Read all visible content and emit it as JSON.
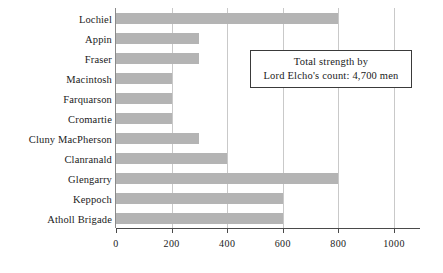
{
  "chart_data": {
    "type": "bar",
    "orientation": "horizontal",
    "title": "",
    "xlabel": "",
    "ylabel": "",
    "categories": [
      "Lochiel",
      "Appin",
      "Fraser",
      "Macintosh",
      "Farquarson",
      "Cromartie",
      "Cluny MacPherson",
      "Clanranald",
      "Glengarry",
      "Keppoch",
      "Atholl Brigade"
    ],
    "values": [
      800,
      300,
      300,
      200,
      200,
      200,
      300,
      400,
      800,
      600,
      600
    ],
    "xlim": [
      0,
      1100
    ],
    "x_ticks": [
      0,
      200,
      400,
      600,
      800,
      1000
    ],
    "x_tick_labels": [
      "0",
      "200",
      "400",
      "600",
      "800",
      "1000"
    ],
    "grid": "vertical",
    "legend": "none",
    "bar_color": "#b4b4b4",
    "annotations": [
      {
        "name": "total-strength-note",
        "lines": [
          "Total strength by",
          "Lord Elcho's count: 4,700 men"
        ]
      }
    ]
  }
}
